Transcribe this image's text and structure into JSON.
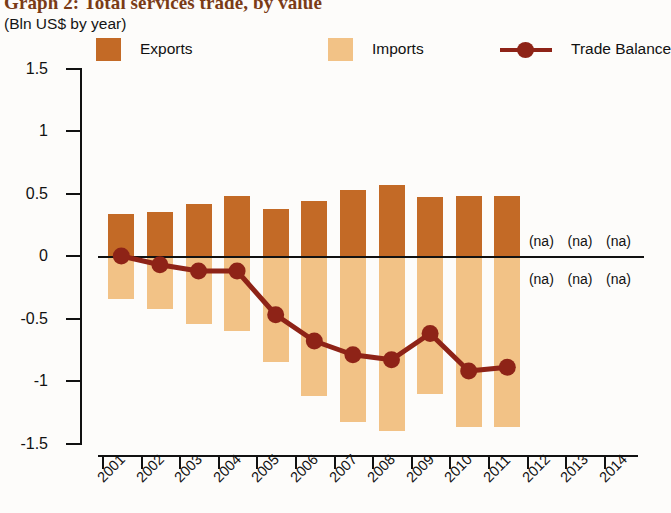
{
  "header": {
    "title": "Graph 2: Total services trade, by value",
    "subtitle": "(Bln US$ by year)"
  },
  "legend": {
    "position": "top",
    "items": [
      {
        "label": "Exports",
        "marker": "square-swatch",
        "color": "#c36a26"
      },
      {
        "label": "Imports",
        "marker": "square-swatch",
        "color": "#f2c286"
      },
      {
        "label": "Trade Balance",
        "marker": "line-with-dot",
        "color": "#8e2317"
      }
    ]
  },
  "colors": {
    "exports": "#c36a26",
    "imports": "#f2c286",
    "trade_balance": "#8e2317",
    "axis": "#111111",
    "title": "#7a3b16",
    "background": "#fdfcfa"
  },
  "na_text": "(na)",
  "chart_data": {
    "type": "bar",
    "title": "Graph 2: Total services trade, by value",
    "subtitle": "(Bln US$ by year)",
    "xlabel": "",
    "ylabel": "",
    "ylim": [
      -1.5,
      1.5
    ],
    "yticks": [
      1.5,
      1,
      0.5,
      0,
      -0.5,
      -1,
      -1.5
    ],
    "ytick_labels": [
      "1.5",
      "1",
      "0.5",
      "0",
      "-0.5",
      "-1",
      "-1.5"
    ],
    "grid": false,
    "zero_line": true,
    "categories": [
      "2001",
      "2002",
      "2003",
      "2004",
      "2005",
      "2006",
      "2007",
      "2008",
      "2009",
      "2010",
      "2011",
      "2012",
      "2013",
      "2014"
    ],
    "series": [
      {
        "name": "Exports",
        "type": "bar",
        "color": "#c36a26",
        "values": [
          0.34,
          0.35,
          0.42,
          0.48,
          0.38,
          0.44,
          0.53,
          0.57,
          0.47,
          0.48,
          0.48,
          null,
          null,
          null
        ],
        "na_categories": [
          "2012",
          "2013",
          "2014"
        ]
      },
      {
        "name": "Imports",
        "type": "bar",
        "color": "#f2c286",
        "values": [
          -0.34,
          -0.42,
          -0.54,
          -0.6,
          -0.85,
          -1.12,
          -1.33,
          -1.4,
          -1.1,
          -1.37,
          -1.37,
          null,
          null,
          null
        ],
        "na_categories": [
          "2012",
          "2013",
          "2014"
        ]
      },
      {
        "name": "Trade Balance",
        "type": "line",
        "color": "#8e2317",
        "marker": "circle",
        "values": [
          0.0,
          -0.07,
          -0.12,
          -0.12,
          -0.47,
          -0.68,
          -0.79,
          -0.83,
          -0.62,
          -0.92,
          -0.89,
          null,
          null,
          null
        ]
      }
    ]
  }
}
